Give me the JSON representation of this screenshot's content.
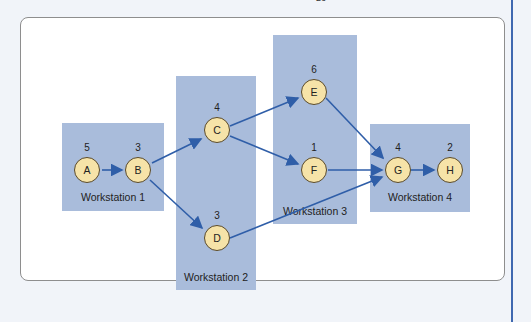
{
  "page": {
    "top_mark": "26"
  },
  "colors": {
    "workstation_fill": "#a9bcdb",
    "node_fill": "#f6e3a8",
    "edge": "#2f5ea8",
    "frame_border": "#8e8e8e"
  },
  "workstations": [
    {
      "id": "ws1",
      "label": "Workstation 1"
    },
    {
      "id": "ws2",
      "label": "Workstation 2"
    },
    {
      "id": "ws3",
      "label": "Workstation 3"
    },
    {
      "id": "ws4",
      "label": "Workstation 4"
    }
  ],
  "nodes": {
    "A": {
      "label": "A",
      "time": "5"
    },
    "B": {
      "label": "B",
      "time": "3"
    },
    "C": {
      "label": "C",
      "time": "4"
    },
    "D": {
      "label": "D",
      "time": "3"
    },
    "E": {
      "label": "E",
      "time": "6"
    },
    "F": {
      "label": "F",
      "time": "1"
    },
    "G": {
      "label": "G",
      "time": "4"
    },
    "H": {
      "label": "H",
      "time": "2"
    }
  },
  "edges": [
    [
      "A",
      "B"
    ],
    [
      "B",
      "C"
    ],
    [
      "B",
      "D"
    ],
    [
      "C",
      "E"
    ],
    [
      "C",
      "F"
    ],
    [
      "E",
      "G"
    ],
    [
      "F",
      "G"
    ],
    [
      "D",
      "G"
    ],
    [
      "G",
      "H"
    ]
  ]
}
